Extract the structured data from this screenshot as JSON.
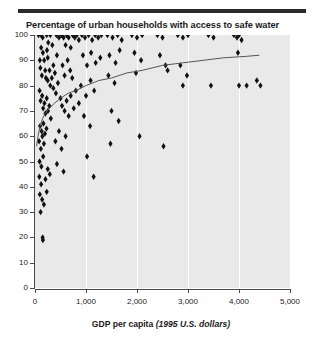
{
  "chart_data": {
    "type": "scatter",
    "title": "Percentage of urban households with access to safe water",
    "xlabel_main": "GDP per capita",
    "xlabel_sub": "(1995 U.S. dollars)",
    "ylabel": "",
    "xlim": [
      0,
      5000
    ],
    "ylim": [
      0,
      100
    ],
    "xticks": [
      0,
      1000,
      2000,
      3000,
      4000,
      5000
    ],
    "xtick_labels": [
      "0",
      "1,000",
      "2,000",
      "3,000",
      "4,000",
      "5,000"
    ],
    "yticks": [
      0,
      10,
      20,
      30,
      40,
      50,
      60,
      70,
      80,
      90,
      100
    ],
    "ytick_labels": [
      "0",
      "10",
      "20",
      "30",
      "40",
      "50",
      "60",
      "70",
      "80",
      "90",
      "100"
    ],
    "grid": "vertical-white-at-x-ticks",
    "legend": "none",
    "marker": "black-diamond",
    "plot_background": "#e9e9e9",
    "marker_color": "#111111",
    "trend_color": "#555555",
    "points": [
      [
        70,
        100
      ],
      [
        120,
        100
      ],
      [
        150,
        99
      ],
      [
        230,
        100
      ],
      [
        260,
        97
      ],
      [
        120,
        95
      ],
      [
        155,
        93
      ],
      [
        235,
        94
      ],
      [
        250,
        91
      ],
      [
        300,
        100
      ],
      [
        340,
        96
      ],
      [
        360,
        88
      ],
      [
        420,
        100
      ],
      [
        430,
        92
      ],
      [
        470,
        99
      ],
      [
        95,
        90
      ],
      [
        105,
        87
      ],
      [
        135,
        84
      ],
      [
        180,
        90
      ],
      [
        200,
        86
      ],
      [
        215,
        83
      ],
      [
        250,
        82
      ],
      [
        285,
        86
      ],
      [
        300,
        80
      ],
      [
        330,
        83
      ],
      [
        360,
        79
      ],
      [
        390,
        85
      ],
      [
        410,
        77
      ],
      [
        450,
        81
      ],
      [
        520,
        100
      ],
      [
        560,
        99
      ],
      [
        600,
        96
      ],
      [
        620,
        100
      ],
      [
        660,
        99
      ],
      [
        700,
        95
      ],
      [
        740,
        100
      ],
      [
        780,
        99
      ],
      [
        820,
        100
      ],
      [
        860,
        98
      ],
      [
        540,
        88
      ],
      [
        580,
        84
      ],
      [
        640,
        90
      ],
      [
        690,
        86
      ],
      [
        730,
        83
      ],
      [
        500,
        75
      ],
      [
        530,
        72
      ],
      [
        580,
        70
      ],
      [
        620,
        74
      ],
      [
        660,
        68
      ],
      [
        700,
        76
      ],
      [
        760,
        71
      ],
      [
        800,
        78
      ],
      [
        860,
        73
      ],
      [
        90,
        78
      ],
      [
        110,
        74
      ],
      [
        140,
        76
      ],
      [
        160,
        71
      ],
      [
        185,
        73
      ],
      [
        205,
        69
      ],
      [
        230,
        75
      ],
      [
        255,
        70
      ],
      [
        280,
        72
      ],
      [
        310,
        67
      ],
      [
        100,
        64
      ],
      [
        130,
        62
      ],
      [
        165,
        65
      ],
      [
        195,
        61
      ],
      [
        225,
        63
      ],
      [
        80,
        58
      ],
      [
        115,
        55
      ],
      [
        145,
        60
      ],
      [
        175,
        57
      ],
      [
        90,
        50
      ],
      [
        125,
        48
      ],
      [
        160,
        52
      ],
      [
        250,
        47
      ],
      [
        85,
        44
      ],
      [
        120,
        41
      ],
      [
        205,
        43
      ],
      [
        290,
        45
      ],
      [
        95,
        37
      ],
      [
        140,
        35
      ],
      [
        230,
        38
      ],
      [
        110,
        30
      ],
      [
        175,
        33
      ],
      [
        150,
        20
      ],
      [
        155,
        19
      ],
      [
        400,
        58
      ],
      [
        470,
        62
      ],
      [
        520,
        55
      ],
      [
        600,
        60
      ],
      [
        430,
        49
      ],
      [
        560,
        46
      ],
      [
        920,
        100
      ],
      [
        980,
        99
      ],
      [
        1050,
        100
      ],
      [
        1120,
        98
      ],
      [
        1180,
        100
      ],
      [
        1240,
        99
      ],
      [
        1300,
        100
      ],
      [
        940,
        92
      ],
      [
        1020,
        88
      ],
      [
        1100,
        93
      ],
      [
        1190,
        89
      ],
      [
        1280,
        91
      ],
      [
        900,
        80
      ],
      [
        1000,
        76
      ],
      [
        1090,
        82
      ],
      [
        1160,
        78
      ],
      [
        960,
        68
      ],
      [
        1080,
        64
      ],
      [
        1020,
        52
      ],
      [
        1150,
        44
      ],
      [
        1420,
        100
      ],
      [
        1520,
        99
      ],
      [
        1620,
        100
      ],
      [
        1700,
        98
      ],
      [
        1460,
        92
      ],
      [
        1580,
        89
      ],
      [
        1660,
        94
      ],
      [
        1440,
        84
      ],
      [
        1560,
        81
      ],
      [
        1500,
        70
      ],
      [
        1640,
        66
      ],
      [
        1480,
        57
      ],
      [
        1900,
        100
      ],
      [
        2000,
        99
      ],
      [
        2100,
        100
      ],
      [
        1950,
        93
      ],
      [
        2080,
        90
      ],
      [
        1980,
        85
      ],
      [
        2050,
        60
      ],
      [
        2400,
        100
      ],
      [
        2500,
        99
      ],
      [
        2450,
        92
      ],
      [
        2560,
        88
      ],
      [
        2600,
        86
      ],
      [
        2520,
        56
      ],
      [
        2800,
        100
      ],
      [
        2900,
        99
      ],
      [
        3000,
        100
      ],
      [
        2850,
        88
      ],
      [
        2980,
        84
      ],
      [
        2900,
        80
      ],
      [
        3400,
        100
      ],
      [
        3500,
        99
      ],
      [
        3450,
        80
      ],
      [
        3900,
        100
      ],
      [
        3960,
        99
      ],
      [
        4000,
        100
      ],
      [
        4050,
        98
      ],
      [
        3980,
        93
      ],
      [
        4000,
        80
      ],
      [
        4150,
        80
      ],
      [
        4350,
        82
      ],
      [
        4420,
        80
      ]
    ],
    "trend_line": {
      "description": "logarithmic fit of access to safe water versus GDP per capita",
      "points": [
        [
          30,
          56
        ],
        [
          60,
          60
        ],
        [
          100,
          64
        ],
        [
          150,
          67
        ],
        [
          200,
          69
        ],
        [
          280,
          71
        ],
        [
          380,
          73
        ],
        [
          500,
          75
        ],
        [
          650,
          77
        ],
        [
          800,
          78
        ],
        [
          1000,
          80
        ],
        [
          1250,
          82
        ],
        [
          1500,
          83
        ],
        [
          1800,
          85
        ],
        [
          2100,
          86
        ],
        [
          2500,
          88
        ],
        [
          2900,
          89
        ],
        [
          3300,
          90
        ],
        [
          3700,
          91
        ],
        [
          4100,
          91.5
        ],
        [
          4400,
          92
        ]
      ]
    }
  }
}
